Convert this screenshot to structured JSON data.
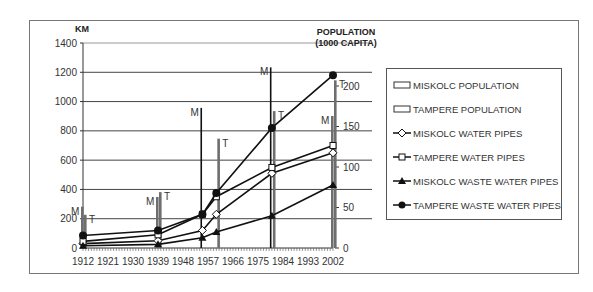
{
  "chart_data": {
    "type": "bar+line",
    "title": "",
    "left_axis": {
      "label": "KM",
      "ticks": [
        0,
        200,
        400,
        600,
        800,
        1000,
        1200,
        1400
      ],
      "range": [
        0,
        1400
      ]
    },
    "right_axis": {
      "label": "POPULATION (1000 CAPITA)",
      "ticks": [
        0,
        50,
        100,
        150,
        200
      ],
      "range": [
        0,
        250
      ]
    },
    "x_ticks": [
      "1912",
      "1921",
      "1930",
      "1939",
      "1948",
      "1957",
      "1966",
      "1975",
      "1984",
      "1993",
      "2002"
    ],
    "x_range": [
      1912,
      2004
    ],
    "grid": true,
    "legend_position": "right",
    "bars": [
      {
        "name": "MISKOLC POPULATION",
        "label": "M",
        "axis": "right",
        "points": [
          {
            "x": 1912,
            "y": 51
          },
          {
            "x": 1939,
            "y": 63
          },
          {
            "x": 1955,
            "y": 173
          },
          {
            "x": 1980,
            "y": 223
          },
          {
            "x": 2002,
            "y": 163
          }
        ]
      },
      {
        "name": "TAMPERE POPULATION",
        "label": "T",
        "axis": "right",
        "points": [
          {
            "x": 1912,
            "y": 41
          },
          {
            "x": 1939,
            "y": 69
          },
          {
            "x": 1960,
            "y": 135
          },
          {
            "x": 1980,
            "y": 169
          },
          {
            "x": 2002,
            "y": 207
          }
        ]
      }
    ],
    "series": [
      {
        "name": "MISKOLC WATER PIPES",
        "marker": "diamond",
        "axis": "left",
        "x": [
          1912,
          1939,
          1955,
          1960,
          1980,
          2002
        ],
        "values": [
          30,
          50,
          120,
          230,
          510,
          650
        ]
      },
      {
        "name": "TAMPERE WATER PIPES",
        "marker": "square",
        "axis": "left",
        "x": [
          1912,
          1939,
          1955,
          1960,
          1980,
          2002
        ],
        "values": [
          45,
          90,
          230,
          350,
          550,
          700
        ]
      },
      {
        "name": "MISKOLC WASTE WATER PIPES",
        "marker": "triangle",
        "axis": "left",
        "x": [
          1912,
          1939,
          1955,
          1960,
          1980,
          2002
        ],
        "values": [
          15,
          25,
          70,
          110,
          220,
          430
        ]
      },
      {
        "name": "TAMPERE WASTE WATER PIPES",
        "marker": "circle",
        "axis": "left",
        "x": [
          1912,
          1939,
          1955,
          1960,
          1980,
          2002
        ],
        "values": [
          85,
          120,
          230,
          375,
          820,
          1180
        ]
      }
    ],
    "legend": [
      "MISKOLC POPULATION",
      "TAMPERE POPULATION",
      "MISKOLC WATER PIPES",
      "TAMPERE WATER PIPES",
      "MISKOLC WASTE WATER PIPES",
      "TAMPERE WASTE WATER PIPES"
    ],
    "colors": {
      "line": "#111111",
      "bar": "#6e6e6e",
      "grid": "#444444",
      "text": "#333333"
    }
  },
  "labels": {
    "left_unit": "KM",
    "right_unit_line1": "POPULATION",
    "right_unit_line2": "(1000 CAPITA)"
  }
}
